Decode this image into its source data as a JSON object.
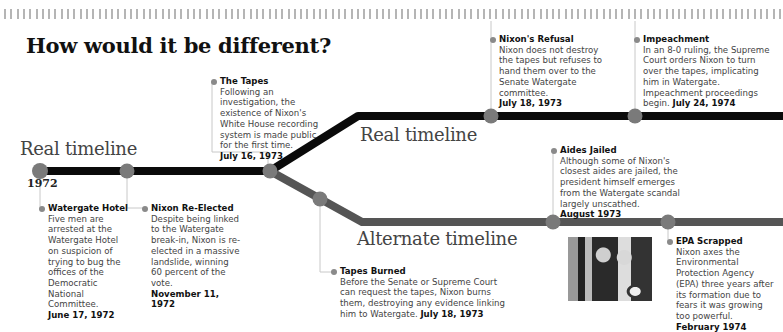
{
  "title": "How would it be different?",
  "labels": {
    "real_left": "Real timeline",
    "real_right": "Real timeline",
    "alternate": "Alternate timeline",
    "start_year": "1972"
  },
  "colors": {
    "real_line": "#0a0a0a",
    "alternate_line": "#555555",
    "node": "#7a7a7a",
    "connector": "#c8c8c8"
  },
  "events": [
    {
      "title": "Watergate Hotel",
      "body": "Five men are arrested at the Watergate Hotel on suspicion of trying to bug the offices of the Democratic National Committee.",
      "date": "June 17, 1972",
      "timeline": "real"
    },
    {
      "title": "Nixon Re-Elected",
      "body": "Despite being linked to the Watergate break-in, Nixon is re-elected in a massive landslide, winning 60 percent of the vote.",
      "date": "November 11, 1972",
      "timeline": "real"
    },
    {
      "title": "The Tapes",
      "body": "Following an investigation, the existence of Nixon's White House recording system is made public for the first time.",
      "date": "July 16, 1973",
      "timeline": "real"
    },
    {
      "title": "Nixon's Refusal",
      "body": "Nixon does not destroy the tapes but refuses to hand them over to the Senate Watergate committee.",
      "date": "July 18, 1973",
      "timeline": "real"
    },
    {
      "title": "Impeachment",
      "body": "In an 8-0 ruling, the Supreme Court orders Nixon to turn over the tapes, implicating him in Watergate. Impeachment proceedings begin.",
      "date": "July 24, 1974",
      "timeline": "real"
    },
    {
      "title": "Tapes Burned",
      "body": "Before the Senate or Supreme Court can request the tapes, Nixon burns them, destroying any evidence linking him to Watergate.",
      "date": "July 18, 1973",
      "timeline": "alternate"
    },
    {
      "title": "Aides Jailed",
      "body": "Although some of Nixon's closest aides are jailed, the president himself emerges from the Watergate scandal largely unscathed.",
      "date": "August 1973",
      "timeline": "alternate"
    },
    {
      "title": "EPA Scrapped",
      "body": "Nixon axes the Environmental Protection Agency (EPA) three years after its formation due to fears it was growing too powerful.",
      "date": "February 1974",
      "timeline": "alternate"
    }
  ],
  "photo": {
    "description": "Nixon at a podium with presidential seal"
  }
}
